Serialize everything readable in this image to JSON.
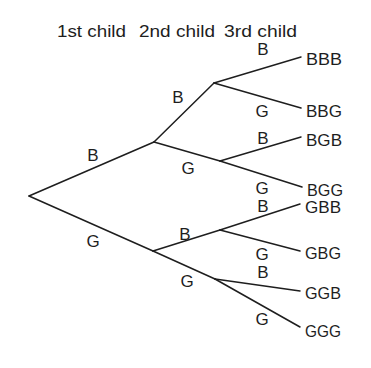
{
  "headers": [
    "1st child",
    "2nd child",
    "3rd child"
  ],
  "colors": {
    "ink": "#1e1e1e",
    "background": "#ffffff"
  },
  "tree": {
    "root": {
      "x": 29,
      "y": 196
    },
    "level1": [
      {
        "id": "B",
        "label": "B",
        "x": 154,
        "y": 142,
        "label_pos": [
          93,
          161
        ]
      },
      {
        "id": "G",
        "label": "G",
        "x": 153,
        "y": 251,
        "label_pos": [
          93,
          247
        ]
      }
    ],
    "level2": [
      {
        "id": "BB",
        "parent": "B",
        "label": "B",
        "x": 214,
        "y": 83,
        "label_pos": [
          178,
          103
        ]
      },
      {
        "id": "BG",
        "parent": "B",
        "label": "G",
        "x": 220,
        "y": 161,
        "label_pos": [
          188,
          174
        ]
      },
      {
        "id": "GB",
        "parent": "G",
        "label": "B",
        "x": 220,
        "y": 230,
        "label_pos": [
          185,
          240
        ]
      },
      {
        "id": "GG",
        "parent": "G",
        "label": "G",
        "x": 215,
        "y": 279,
        "label_pos": [
          187,
          287
        ]
      }
    ],
    "leaves": [
      {
        "parent": "BB",
        "label": "B",
        "outcome": "BBB",
        "x": 301,
        "y": 57,
        "label_pos": [
          263,
          55
        ],
        "text_y": 65
      },
      {
        "parent": "BB",
        "label": "G",
        "outcome": "BBG",
        "x": 301,
        "y": 108,
        "label_pos": [
          262,
          117
        ],
        "text_y": 117
      },
      {
        "parent": "BG",
        "label": "B",
        "outcome": "BGB",
        "x": 301,
        "y": 137,
        "label_pos": [
          263,
          144
        ],
        "text_y": 146
      },
      {
        "parent": "BG",
        "label": "G",
        "outcome": "BGG",
        "x": 302,
        "y": 187,
        "label_pos": [
          262,
          194
        ],
        "text_y": 196
      },
      {
        "parent": "GB",
        "label": "B",
        "outcome": "GBB",
        "x": 300,
        "y": 204,
        "label_pos": [
          263,
          212
        ],
        "text_y": 213
      },
      {
        "parent": "GB",
        "label": "G",
        "outcome": "GBG",
        "x": 300,
        "y": 251,
        "label_pos": [
          262,
          260
        ],
        "text_y": 259
      },
      {
        "parent": "GG",
        "label": "B",
        "outcome": "GGB",
        "x": 300,
        "y": 291,
        "label_pos": [
          263,
          278
        ],
        "text_y": 299
      },
      {
        "parent": "GG",
        "label": "G",
        "outcome": "GGG",
        "x": 300,
        "y": 327,
        "label_pos": [
          262,
          325
        ],
        "text_y": 337
      }
    ]
  }
}
